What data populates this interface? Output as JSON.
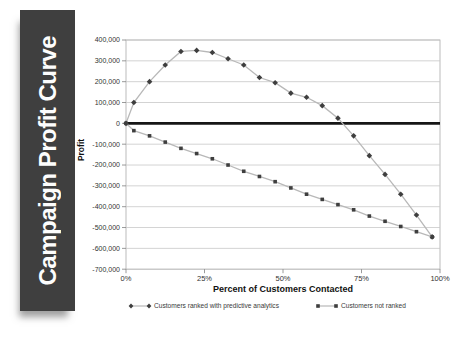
{
  "banner": {
    "title": "Campaign Profit Curve",
    "bg_color": "#3f3f3f",
    "text_color": "#fdfdfd"
  },
  "chart_data": {
    "type": "line",
    "title": "Campaign Profit Curve",
    "xlabel": "Percent of Customers Contacted",
    "ylabel": "Profit",
    "xlim": [
      0,
      100
    ],
    "ylim": [
      -700000,
      400000
    ],
    "grid": true,
    "zero_line": true,
    "legend_position": "bottom",
    "xticks": [
      0,
      25,
      50,
      75,
      100
    ],
    "xtick_labels": [
      "0%",
      "25%",
      "50%",
      "75%",
      "100%"
    ],
    "yticks": [
      400000,
      300000,
      200000,
      100000,
      0,
      -100000,
      -200000,
      -300000,
      -400000,
      -500000,
      -600000,
      -700000
    ],
    "ytick_labels": [
      "400,000",
      "300,000",
      "200,000",
      "100,000",
      "0",
      "-100,000",
      "-200,000",
      "-300,000",
      "-400,000",
      "-500,000",
      "-600,000",
      "-700,000"
    ],
    "x": [
      0,
      2.5,
      7.5,
      12.5,
      17.5,
      22.5,
      27.5,
      32.5,
      37.5,
      42.5,
      47.5,
      52.5,
      57.5,
      62.5,
      67.5,
      72.5,
      77.5,
      82.5,
      87.5,
      92.5,
      97.5
    ],
    "series": [
      {
        "key": "ranked",
        "name": "Customers ranked with predictive analytics",
        "marker": "diamond",
        "y": [
          0,
          100000,
          200000,
          280000,
          345000,
          350000,
          340000,
          310000,
          280000,
          220000,
          195000,
          145000,
          125000,
          85000,
          25000,
          -60000,
          -155000,
          -245000,
          -340000,
          -440000,
          -545000
        ]
      },
      {
        "key": "not-ranked",
        "name": "Customers not ranked",
        "marker": "square",
        "y": [
          0,
          -35000,
          -60000,
          -90000,
          -120000,
          -145000,
          -170000,
          -200000,
          -230000,
          -255000,
          -280000,
          -310000,
          -340000,
          -365000,
          -390000,
          -415000,
          -445000,
          -470000,
          -495000,
          -520000,
          -545000
        ]
      }
    ],
    "colors": {
      "marker": "#3e3e3e",
      "series_line": "#b8b8b8",
      "gridline": "#c8c8c8",
      "plot_border": "#aaaaaa",
      "zero_line": "#161616",
      "tick_text": "#333333",
      "axis_title_text": "#111111",
      "legend_text": "#3a3a3a"
    }
  }
}
